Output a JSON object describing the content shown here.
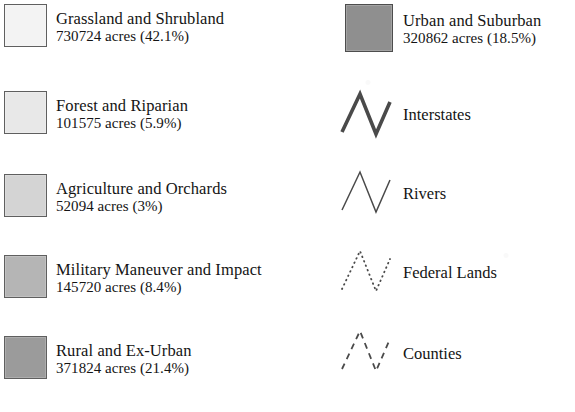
{
  "legend": {
    "left_column": [
      {
        "swatch_color": "#f3f3f3",
        "border_color": "#5f5f5f",
        "name": "Grassland and Shrubland",
        "stats": "730724 acres (42.1%)",
        "acres": 730724,
        "percent": 42.1,
        "top": 4
      },
      {
        "swatch_color": "#e8e8e8",
        "border_color": "#5f5f5f",
        "name": "Forest and Riparian",
        "stats": "101575 acres (5.9%)",
        "acres": 101575,
        "percent": 5.9,
        "top": 91
      },
      {
        "swatch_color": "#d4d4d4",
        "border_color": "#5f5f5f",
        "name": "Agriculture and Orchards",
        "stats": "52094 acres (3%)",
        "acres": 52094,
        "percent": 3,
        "top": 174
      },
      {
        "swatch_color": "#b5b5b5",
        "border_color": "#5f5f5f",
        "name": "Military Maneuver and Impact",
        "stats": "145720 acres (8.4%)",
        "acres": 145720,
        "percent": 8.4,
        "top": 255
      },
      {
        "swatch_color": "#9b9b9b",
        "border_color": "#5f5f5f",
        "name": "Rural and Ex-Urban",
        "stats": "371824 acres (21.4%)",
        "acres": 371824,
        "percent": 21.4,
        "top": 336
      }
    ],
    "right_column_area": [
      {
        "swatch_color": "#8f8f8f",
        "border_color": "#4d4d4d",
        "name": "Urban and Suburban",
        "stats": "320862 acres (18.5%)",
        "acres": 320862,
        "percent": 18.5,
        "top": 4
      }
    ],
    "right_column_lines": [
      {
        "icon": "zigzag-line-icon",
        "label": "Interstates",
        "style": "solid",
        "stroke_color": "#4a4a4a",
        "stroke_width": 3.6,
        "dash": "none",
        "top": 88,
        "label_top": 105
      },
      {
        "icon": "zigzag-line-icon",
        "label": "Rivers",
        "style": "solid-thin",
        "stroke_color": "#4a4a4a",
        "stroke_width": 1.5,
        "dash": "none",
        "top": 166,
        "label_top": 184
      },
      {
        "icon": "zigzag-line-icon",
        "label": "Federal Lands",
        "style": "dotted",
        "stroke_color": "#4a4a4a",
        "stroke_width": 1.8,
        "dash": "0.6 4.2",
        "top": 245,
        "label_top": 263
      },
      {
        "icon": "zigzag-line-icon",
        "label": "Counties",
        "style": "dashed",
        "stroke_color": "#4a4a4a",
        "stroke_width": 1.8,
        "dash": "6 5",
        "top": 325,
        "label_top": 344
      }
    ]
  }
}
